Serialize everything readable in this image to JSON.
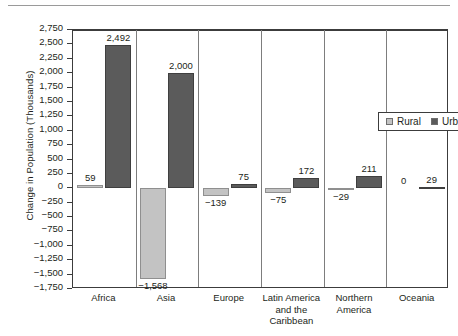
{
  "chart_data": {
    "type": "bar",
    "title": "",
    "xlabel": "",
    "ylabel": "Change in Population (Thousands)",
    "ylim": [
      -1750,
      2750
    ],
    "ytick_step": 250,
    "grid": false,
    "legend_position": "inside-upper-right",
    "categories": [
      "Africa",
      "Asia",
      "Europe",
      "Latin America and the Caribbean",
      "Northern America",
      "Oceania"
    ],
    "category_label_lines": [
      [
        "Africa"
      ],
      [
        "Asia"
      ],
      [
        "Europe"
      ],
      [
        "Latin America",
        "and the",
        "Caribbean"
      ],
      [
        "Northern",
        "America"
      ],
      [
        "Oceania"
      ]
    ],
    "series": [
      {
        "name": "Rural",
        "color": "#c3c3c3",
        "values": [
          59,
          -1568,
          -139,
          -75,
          -29,
          0
        ],
        "labels": [
          "59",
          "−1,568",
          "−139",
          "−75",
          "−29",
          "0"
        ]
      },
      {
        "name": "Urban",
        "color": "#5b5b5b",
        "values": [
          2492,
          2000,
          75,
          172,
          211,
          29
        ],
        "labels": [
          "2,492",
          "2,000",
          "75",
          "172",
          "211",
          "29"
        ]
      }
    ],
    "ytick_labels": [
      "2,750",
      "2,500",
      "2,250",
      "2,000",
      "1,750",
      "1,500",
      "1,250",
      "1,000",
      "750",
      "500",
      "250",
      "0",
      "−250",
      "−500",
      "−750",
      "−1,000",
      "−1,250",
      "−1,500",
      "−1,750"
    ],
    "ytick_values": [
      2750,
      2500,
      2250,
      2000,
      1750,
      1500,
      1250,
      1000,
      750,
      500,
      250,
      0,
      -250,
      -500,
      -750,
      -1000,
      -1250,
      -1500,
      -1750
    ]
  },
  "legend": {
    "items": [
      {
        "label": "Rural",
        "color": "#c3c3c3"
      },
      {
        "label": "Urban",
        "color": "#5b5b5b"
      }
    ]
  }
}
